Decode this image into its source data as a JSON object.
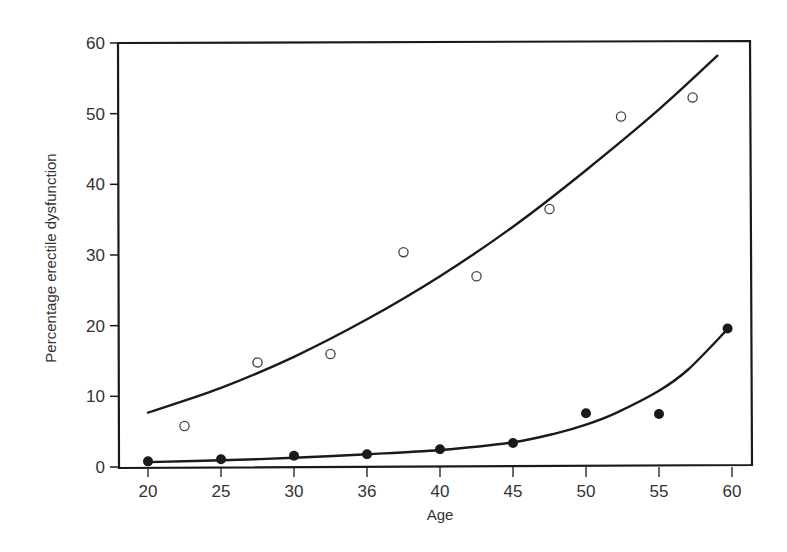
{
  "chart_data": {
    "type": "scatter",
    "title": "",
    "xlabel": "Age",
    "ylabel": "Percentage erectile dysfunction",
    "xlim": [
      20,
      60
    ],
    "ylim": [
      0,
      60
    ],
    "x_ticks": [
      {
        "value": 20,
        "label": "20"
      },
      {
        "value": 25,
        "label": "25"
      },
      {
        "value": 30,
        "label": "30"
      },
      {
        "value": 35,
        "label": "36"
      },
      {
        "value": 40,
        "label": "40"
      },
      {
        "value": 45,
        "label": "45"
      },
      {
        "value": 50,
        "label": "50"
      },
      {
        "value": 55,
        "label": "55"
      },
      {
        "value": 60,
        "label": "60"
      }
    ],
    "y_ticks": [
      0,
      10,
      20,
      30,
      40,
      50,
      60
    ],
    "grid": false,
    "legend": null,
    "series": [
      {
        "name": "open-circles",
        "marker": "open-circle",
        "points": [
          {
            "x": 22.5,
            "y": 5.8
          },
          {
            "x": 27.5,
            "y": 14.8
          },
          {
            "x": 32.5,
            "y": 16.0
          },
          {
            "x": 37.5,
            "y": 30.4
          },
          {
            "x": 42.5,
            "y": 27.0
          },
          {
            "x": 47.5,
            "y": 36.5
          },
          {
            "x": 52.4,
            "y": 49.6
          },
          {
            "x": 57.3,
            "y": 52.3
          }
        ],
        "fit_curve": [
          {
            "x": 20,
            "y": 7.7
          },
          {
            "x": 25,
            "y": 11.2
          },
          {
            "x": 30,
            "y": 15.6
          },
          {
            "x": 35,
            "y": 20.9
          },
          {
            "x": 40,
            "y": 27.0
          },
          {
            "x": 45,
            "y": 34.0
          },
          {
            "x": 50,
            "y": 42.0
          },
          {
            "x": 55,
            "y": 50.6
          },
          {
            "x": 59,
            "y": 58.2
          }
        ]
      },
      {
        "name": "filled-circles",
        "marker": "filled-circle",
        "points": [
          {
            "x": 20,
            "y": 0.8
          },
          {
            "x": 25,
            "y": 1.1
          },
          {
            "x": 30,
            "y": 1.6
          },
          {
            "x": 35,
            "y": 1.8
          },
          {
            "x": 40,
            "y": 2.5
          },
          {
            "x": 45,
            "y": 3.4
          },
          {
            "x": 50,
            "y": 7.6
          },
          {
            "x": 55,
            "y": 7.5
          },
          {
            "x": 59.7,
            "y": 19.6
          }
        ],
        "fit_curve": [
          {
            "x": 20,
            "y": 0.7
          },
          {
            "x": 25,
            "y": 0.95
          },
          {
            "x": 30,
            "y": 1.3
          },
          {
            "x": 35,
            "y": 1.8
          },
          {
            "x": 40,
            "y": 2.4
          },
          {
            "x": 45,
            "y": 3.5
          },
          {
            "x": 48,
            "y": 4.8
          },
          {
            "x": 50,
            "y": 6.0
          },
          {
            "x": 52,
            "y": 7.6
          },
          {
            "x": 55,
            "y": 10.8
          },
          {
            "x": 57,
            "y": 13.8
          },
          {
            "x": 59.7,
            "y": 19.5
          }
        ]
      }
    ]
  },
  "colors": {
    "ink": "#1a1a1a",
    "text": "#333333",
    "background": "#ffffff"
  }
}
